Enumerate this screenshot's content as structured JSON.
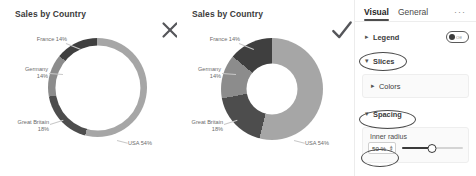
{
  "charts": [
    {
      "id": "chart-before",
      "title": "Sales by Country",
      "mark": "x-mark",
      "inner_radius_pct": 86,
      "chart_data": {
        "type": "pie",
        "title": "Sales by Country",
        "categories": [
          "USA",
          "Great Britain",
          "Germany",
          "France"
        ],
        "values": [
          54,
          18,
          14,
          14
        ],
        "labels": [
          "USA 54%",
          "Great Britain 18%",
          "Germany 14%",
          "France 14%"
        ],
        "colors": [
          "#a6a6a6",
          "#4d4d4d",
          "#8c8c8c",
          "#3f3f3f"
        ],
        "legend": "off",
        "donut_inner_radius": "86%"
      }
    },
    {
      "id": "chart-after",
      "title": "Sales by Country",
      "mark": "check-mark",
      "inner_radius_pct": 50,
      "chart_data": {
        "type": "pie",
        "title": "Sales by Country",
        "categories": [
          "USA",
          "Great Britain",
          "Germany",
          "France"
        ],
        "values": [
          54,
          18,
          14,
          14
        ],
        "labels": [
          "USA 54%",
          "Great Britain 18%",
          "Germany 14%",
          "France 14%"
        ],
        "colors": [
          "#a6a6a6",
          "#4d4d4d",
          "#8c8c8c",
          "#3f3f3f"
        ],
        "legend": "off",
        "donut_inner_radius": "50%"
      }
    }
  ],
  "labels": {
    "usa": "USA 54%",
    "great_britain_name": "Great Britain",
    "great_britain_pct": "18%",
    "germany_name": "Germany",
    "germany_pct": "14%",
    "france": "France 14%"
  },
  "pane": {
    "tabs": [
      {
        "label": "Visual",
        "active": true
      },
      {
        "label": "General",
        "active": false
      }
    ],
    "more_label": "···",
    "sections": {
      "legend": {
        "label": "Legend",
        "chevron": "chevron-right",
        "toggle_state": "Off",
        "toggle_text": "Off"
      },
      "slices": {
        "label": "Slices",
        "chevron": "chevron-up"
      },
      "colors": {
        "label": "Colors",
        "chevron": "chevron-right"
      },
      "spacing": {
        "label": "Spacing",
        "chevron": "chevron-down"
      },
      "inner_radius": {
        "label": "Inner radius",
        "value": "50 %",
        "slider_percent": 50
      }
    }
  }
}
